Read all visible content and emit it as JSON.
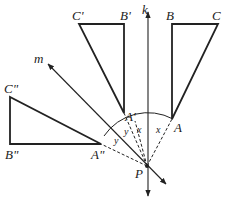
{
  "diagram": {
    "type": "geometry-reflection",
    "lines": {
      "k": {
        "label": "k",
        "direction": "vertical"
      },
      "m": {
        "label": "m",
        "direction": "diagonal"
      }
    },
    "point_P": {
      "label": "P"
    },
    "triangles": [
      {
        "name": "ABC",
        "vertices": {
          "A": "A",
          "B": "B",
          "C": "C"
        }
      },
      {
        "name": "A'B'C'",
        "vertices": {
          "A": "A'",
          "B": "B'",
          "C": "C'"
        }
      },
      {
        "name": "A''B''C''",
        "vertices": {
          "A": "A\"",
          "B": "B\"",
          "C": "C\""
        }
      }
    ],
    "angle_labels": {
      "x1": "x",
      "x2": "x",
      "y1": "y",
      "y2": "y"
    },
    "colors": {
      "stroke": "#222222",
      "background": "#ffffff"
    }
  }
}
